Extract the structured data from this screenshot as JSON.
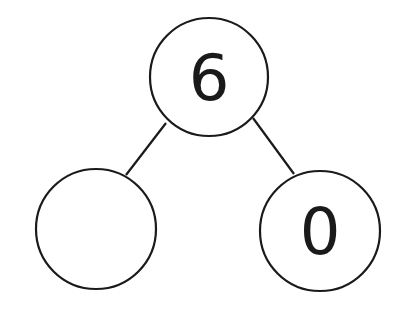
{
  "diagram": {
    "type": "number-bond",
    "whole": {
      "value": "6"
    },
    "parts": [
      {
        "value": ""
      },
      {
        "value": "0"
      }
    ]
  }
}
